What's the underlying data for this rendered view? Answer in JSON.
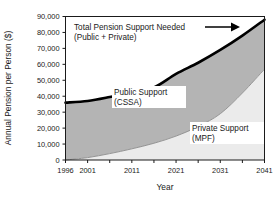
{
  "chart_data": {
    "type": "area",
    "title": "",
    "xlabel": "Year",
    "ylabel": "Annual Pension per Person ($)",
    "xlim": [
      1996,
      2041
    ],
    "ylim": [
      0,
      90000
    ],
    "grid": false,
    "stacked": true,
    "legend_position": "inline-annotations",
    "x": [
      1996,
      2001,
      2006,
      2011,
      2016,
      2021,
      2026,
      2031,
      2036,
      2041
    ],
    "xticks": [
      1996,
      2001,
      2006,
      2011,
      2016,
      2021,
      2026,
      2031,
      2036,
      2041
    ],
    "xtick_labels": [
      "1996",
      "2001",
      "",
      "2011",
      "",
      "2021",
      "",
      "2031",
      "",
      "2041"
    ],
    "yticks": [
      0,
      10000,
      20000,
      30000,
      40000,
      50000,
      60000,
      70000,
      80000,
      90000
    ],
    "ytick_labels": [
      "0",
      "10,000",
      "20,000",
      "30,000",
      "40,000",
      "50,000",
      "60,000",
      "70,000",
      "80,000",
      "90,000"
    ],
    "series": [
      {
        "name": "Private Support (MPF)",
        "values": [
          0,
          1500,
          4000,
          7000,
          10500,
          15000,
          21000,
          29000,
          42000,
          57000
        ],
        "color": "#ebebeb"
      },
      {
        "name": "Public Support (CSSA)",
        "values": [
          36000,
          35500,
          35500,
          35500,
          35000,
          39000,
          40000,
          40000,
          36000,
          31000
        ],
        "color": "#b4b4b4"
      }
    ],
    "total": {
      "name": "Total Pension Support Needed (Public + Private)",
      "values": [
        36000,
        37000,
        39500,
        42500,
        45500,
        54000,
        61000,
        69000,
        78000,
        88000
      ],
      "color": "#000000"
    },
    "annotations": [
      {
        "id": "total-label",
        "line1": "Total Pension Support Needed",
        "line2": "(Public + Private)",
        "has_arrow": true
      },
      {
        "id": "public-label",
        "line1": "Public Support",
        "line2": "(CSSA)"
      },
      {
        "id": "private-label",
        "line1": "Private Support",
        "line2": "(MPF)"
      }
    ]
  }
}
